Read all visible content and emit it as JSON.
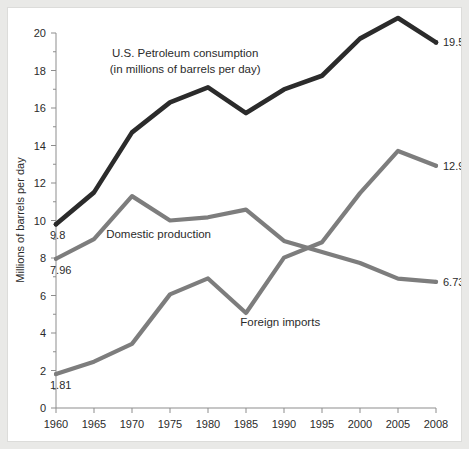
{
  "chart_data": {
    "type": "line",
    "title": "U.S. Petroleum consumption",
    "subtitle": "(in millions of barrels per day)",
    "xlabel": "",
    "ylabel": "Millions of barrels per day",
    "xlim": [
      1960,
      2008
    ],
    "ylim": [
      0,
      20
    ],
    "grid": false,
    "legend_position": "inline-annotations",
    "x": [
      1960,
      1965,
      1970,
      1975,
      1980,
      1985,
      1990,
      1995,
      2000,
      2005,
      2008
    ],
    "xticklabels": [
      "1960",
      "1965",
      "1970",
      "1975",
      "1980",
      "1985",
      "1990",
      "1995",
      "2000",
      "2005",
      "2008"
    ],
    "yticks": [
      0,
      2,
      4,
      6,
      8,
      10,
      12,
      14,
      16,
      18,
      20
    ],
    "yticklabels": [
      "0",
      "2",
      "4",
      "6",
      "8",
      "10",
      "12",
      "14",
      "16",
      "18",
      "20"
    ],
    "series": [
      {
        "name": "U.S. Petroleum consumption",
        "color": "#2b2b2b",
        "values": [
          9.8,
          11.5,
          14.7,
          16.3,
          17.1,
          15.73,
          16.99,
          17.72,
          19.7,
          20.8,
          19.5
        ],
        "start_label": "9.8",
        "end_label": "19.5"
      },
      {
        "name": "Domestic production",
        "color": "#7d7d7d",
        "values": [
          7.96,
          9.01,
          11.3,
          10.0,
          10.17,
          10.58,
          8.91,
          8.32,
          7.73,
          6.9,
          6.73
        ],
        "start_label": "7.96",
        "end_label": "6.73"
      },
      {
        "name": "Foreign imports",
        "color": "#7d7d7d",
        "values": [
          1.81,
          2.47,
          3.42,
          6.06,
          6.91,
          5.07,
          8.02,
          8.84,
          11.46,
          13.71,
          12.92
        ],
        "start_label": "1.81",
        "end_label": "12.92"
      }
    ],
    "annotations": [
      {
        "text": "U.S. Petroleum consumption",
        "x": 1977,
        "y": 18.7
      },
      {
        "text": "(in millions of barrels per day)",
        "x": 1977,
        "y": 17.85
      },
      {
        "text": "Domestic production",
        "x": 1973.5,
        "y": 9.05
      },
      {
        "text": "Foreign imports",
        "x": 1989.5,
        "y": 4.35
      }
    ]
  }
}
